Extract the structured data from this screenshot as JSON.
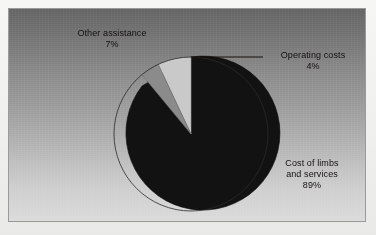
{
  "chart_data": {
    "type": "pie",
    "title": "",
    "subtitle": "",
    "xlabel": "",
    "ylabel": "",
    "legend_position": "none",
    "grid": false,
    "units": "percent",
    "start_angle_deg": 0,
    "direction": "clockwise",
    "categories": [
      "Cost of limbs and services",
      "Other assistance",
      "Operating costs"
    ],
    "values": [
      89,
      7,
      4
    ],
    "slices": [
      {
        "name": "Cost of limbs and services",
        "label_line1": "Cost of limbs",
        "label_line2": "and services",
        "value": 89,
        "value_label": "89%",
        "color": "#121212",
        "order": 1
      },
      {
        "name": "Other assistance",
        "label_line1": "Other assistance",
        "label_line2": "",
        "value": 7,
        "value_label": "7%",
        "color": "#c9c9c9",
        "order": 3
      },
      {
        "name": "Operating costs",
        "label_line1": "Operating costs",
        "label_line2": "",
        "value": 4,
        "value_label": "4%",
        "color": "#8b8b8b",
        "order": 2
      }
    ],
    "annotations": [
      {
        "name": "operating-costs-leader-line",
        "type": "leader-line",
        "from": [
          190,
          56
        ],
        "to": [
          262,
          56
        ]
      }
    ]
  },
  "labels": {
    "other_assistance": {
      "text": "Other assistance",
      "value": "7%"
    },
    "operating_costs": {
      "text": "Operating costs",
      "value": "4%"
    },
    "cost_of_limbs": {
      "line1": "Cost of limbs",
      "line2": "and services",
      "value": "89%"
    }
  },
  "colors": {
    "slice_dark": "#121212",
    "slice_light": "#c9c9c9",
    "slice_medium": "#8b8b8b",
    "panel_top": "#686868",
    "panel_bottom": "#dcdcdc",
    "panel_border": "#9a9a9a",
    "text": "#14110f",
    "leader_line": "#14110f"
  }
}
